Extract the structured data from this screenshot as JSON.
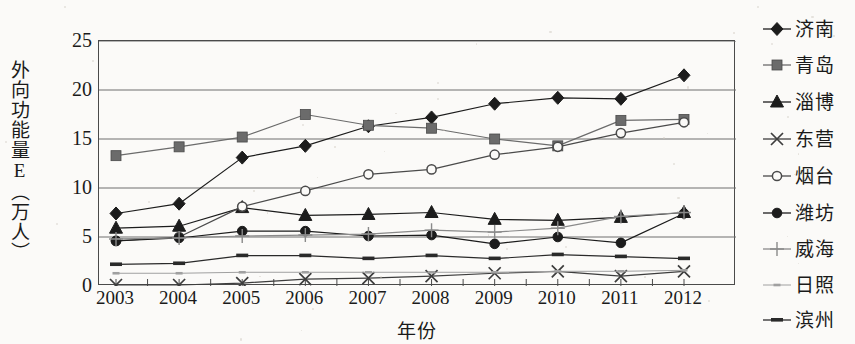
{
  "chart_data": {
    "type": "line",
    "title": "",
    "xlabel": "年份",
    "ylabel": "外向功能量E（万人）",
    "x": [
      2003,
      2004,
      2005,
      2006,
      2007,
      2008,
      2009,
      2010,
      2011,
      2012
    ],
    "categories": [
      "2003",
      "2004",
      "2005",
      "2006",
      "2007",
      "2008",
      "2009",
      "2010",
      "2011",
      "2012"
    ],
    "ylim": [
      0,
      25
    ],
    "yticks": [
      0,
      5,
      10,
      15,
      20,
      25
    ],
    "grid": "horizontal",
    "legend_position": "right",
    "series": [
      {
        "name": "济南",
        "marker": "diamond",
        "color": "#1c1c1c",
        "values": [
          7.4,
          8.4,
          13.1,
          14.3,
          16.3,
          17.2,
          18.6,
          19.2,
          19.1,
          21.5
        ]
      },
      {
        "name": "青岛",
        "marker": "square",
        "color": "#6b6b6b",
        "values": [
          13.3,
          14.2,
          15.2,
          17.5,
          16.4,
          16.1,
          15.0,
          14.3,
          16.9,
          17.0
        ]
      },
      {
        "name": "淄博",
        "marker": "triangle",
        "color": "#1c1c1c",
        "values": [
          5.9,
          6.1,
          8.0,
          7.2,
          7.3,
          7.5,
          6.8,
          6.7,
          7.0,
          7.5
        ]
      },
      {
        "name": "东营",
        "marker": "cross",
        "color": "#3d3d3d",
        "values": [
          0.1,
          0.1,
          0.3,
          0.7,
          0.8,
          1.0,
          1.3,
          1.5,
          1.0,
          1.5
        ]
      },
      {
        "name": "烟台",
        "marker": "circle-open",
        "color": "#4a4a4a",
        "values": [
          4.6,
          5.0,
          8.1,
          9.7,
          11.4,
          11.9,
          13.4,
          14.2,
          15.6,
          16.7
        ]
      },
      {
        "name": "潍坊",
        "marker": "circle-filled",
        "color": "#1c1c1c",
        "values": [
          4.6,
          4.9,
          5.6,
          5.6,
          5.1,
          5.2,
          4.3,
          5.0,
          4.4,
          7.4
        ]
      },
      {
        "name": "威海",
        "marker": "plus",
        "color": "#8a8a8a",
        "values": [
          4.8,
          4.9,
          5.1,
          5.2,
          5.3,
          5.7,
          5.5,
          5.9,
          7.1,
          7.5
        ]
      },
      {
        "name": "日照",
        "marker": "dash-light",
        "color": "#a0a0a0",
        "values": [
          1.3,
          1.3,
          1.4,
          1.4,
          1.4,
          1.4,
          1.4,
          1.5,
          1.5,
          1.6
        ]
      },
      {
        "name": "滨州",
        "marker": "dash-dark",
        "color": "#2a2a2a",
        "values": [
          2.2,
          2.3,
          3.1,
          3.1,
          2.8,
          3.1,
          2.8,
          3.2,
          3.0,
          2.8
        ]
      }
    ]
  },
  "legend": {
    "items": [
      {
        "label": "济南"
      },
      {
        "label": "青岛"
      },
      {
        "label": "淄博"
      },
      {
        "label": "东营"
      },
      {
        "label": "烟台"
      },
      {
        "label": "潍坊"
      },
      {
        "label": "威海"
      },
      {
        "label": "日照"
      },
      {
        "label": "滨州"
      }
    ]
  }
}
